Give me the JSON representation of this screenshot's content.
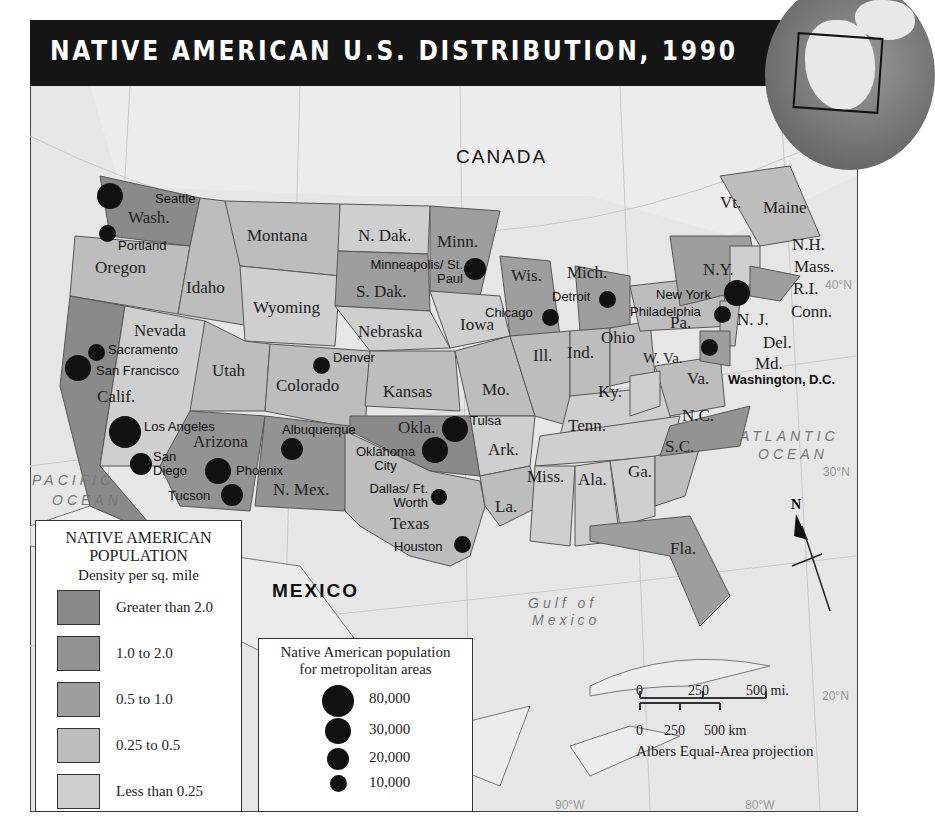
{
  "title": "NATIVE AMERICAN U.S. DISTRIBUTION, 1990",
  "colors": {
    "greater_than_2": "#8a8a8a",
    "1_to_2": "#939393",
    "0_5_to_1": "#9e9e9e",
    "0_25_to_0_5": "#bdbdbd",
    "less_than_0_25": "#cfcfcf",
    "water": "#e6e6e6",
    "title_bar": "#151515"
  },
  "countries": {
    "canada": "CANADA",
    "mexico": "MEXICO"
  },
  "water_bodies": {
    "pacific_1": "PACIFIC",
    "pacific_2": "OCEAN",
    "atlantic_1": "ATLANTIC",
    "atlantic_2": "OCEAN",
    "gulf_1": "Gulf of",
    "gulf_2": "Mexico"
  },
  "graticule": {
    "lat40": "40°N",
    "lat30": "30°N",
    "lat20": "20°N",
    "lon90": "90°W",
    "lon80": "80°W"
  },
  "states": [
    {
      "name": "Wash.",
      "density": "greater_than_2"
    },
    {
      "name": "Oregon",
      "density": "0_25_to_0_5"
    },
    {
      "name": "Idaho",
      "density": "0_25_to_0_5"
    },
    {
      "name": "Montana",
      "density": "0_25_to_0_5"
    },
    {
      "name": "Wyoming",
      "density": "less_than_0_25"
    },
    {
      "name": "Nevada",
      "density": "less_than_0_25"
    },
    {
      "name": "Calif.",
      "density": "greater_than_2"
    },
    {
      "name": "Utah",
      "density": "0_25_to_0_5"
    },
    {
      "name": "Colorado",
      "density": "0_25_to_0_5"
    },
    {
      "name": "Arizona",
      "density": "1_to_2"
    },
    {
      "name": "N. Mex.",
      "density": "1_to_2"
    },
    {
      "name": "N. Dak.",
      "density": "less_than_0_25"
    },
    {
      "name": "S. Dak.",
      "density": "0_5_to_1"
    },
    {
      "name": "Nebraska",
      "density": "less_than_0_25"
    },
    {
      "name": "Kansas",
      "density": "0_25_to_0_5"
    },
    {
      "name": "Okla.",
      "density": "greater_than_2"
    },
    {
      "name": "Texas",
      "density": "0_25_to_0_5"
    },
    {
      "name": "Minn.",
      "density": "0_5_to_1"
    },
    {
      "name": "Iowa",
      "density": "less_than_0_25"
    },
    {
      "name": "Mo.",
      "density": "0_25_to_0_5"
    },
    {
      "name": "Ark.",
      "density": "less_than_0_25"
    },
    {
      "name": "La.",
      "density": "0_25_to_0_5"
    },
    {
      "name": "Wis.",
      "density": "0_5_to_1"
    },
    {
      "name": "Ill.",
      "density": "0_25_to_0_5"
    },
    {
      "name": "Mich.",
      "density": "0_5_to_1"
    },
    {
      "name": "Ind.",
      "density": "0_25_to_0_5"
    },
    {
      "name": "Ohio",
      "density": "0_25_to_0_5"
    },
    {
      "name": "Ky.",
      "density": "less_than_0_25"
    },
    {
      "name": "Tenn.",
      "density": "less_than_0_25"
    },
    {
      "name": "Miss.",
      "density": "less_than_0_25"
    },
    {
      "name": "Ala.",
      "density": "less_than_0_25"
    },
    {
      "name": "Ga.",
      "density": "less_than_0_25"
    },
    {
      "name": "Fla.",
      "density": "0_5_to_1"
    },
    {
      "name": "S.C.",
      "density": "0_25_to_0_5"
    },
    {
      "name": "N.C.",
      "density": "1_to_2"
    },
    {
      "name": "Va.",
      "density": "0_25_to_0_5"
    },
    {
      "name": "W. Va.",
      "density": "less_than_0_25"
    },
    {
      "name": "Pa.",
      "density": "0_25_to_0_5"
    },
    {
      "name": "N.Y.",
      "density": "0_5_to_1"
    },
    {
      "name": "Vt.",
      "density": "less_than_0_25"
    },
    {
      "name": "Maine",
      "density": "0_25_to_0_5"
    },
    {
      "name": "N.H.",
      "density": "less_than_0_25"
    },
    {
      "name": "Mass.",
      "density": "0_5_to_1"
    },
    {
      "name": "R.I.",
      "density": "0_5_to_1"
    },
    {
      "name": "Conn.",
      "density": "0_5_to_1"
    },
    {
      "name": "N. J.",
      "density": "0_25_to_0_5"
    },
    {
      "name": "Del.",
      "density": "0_25_to_0_5"
    },
    {
      "name": "Md.",
      "density": "0_5_to_1"
    }
  ],
  "cities": [
    {
      "name": "Seattle",
      "size": 30000
    },
    {
      "name": "Portland",
      "size": 10000
    },
    {
      "name": "Sacramento",
      "size": 10000
    },
    {
      "name": "San Francisco",
      "size": 30000
    },
    {
      "name": "Los Angeles",
      "size": 80000
    },
    {
      "name": "San Diego",
      "size": 20000
    },
    {
      "name": "Phoenix",
      "size": 30000
    },
    {
      "name": "Tucson",
      "size": 20000
    },
    {
      "name": "Albuquerque",
      "size": 20000
    },
    {
      "name": "Denver",
      "size": 10000
    },
    {
      "name": "Minneapolis/ St. Paul",
      "size": 20000
    },
    {
      "name": "Tulsa",
      "size": 30000
    },
    {
      "name": "Oklahoma City",
      "size": 30000
    },
    {
      "name": "Dallas/ Ft. Worth",
      "size": 10000
    },
    {
      "name": "Houston",
      "size": 10000
    },
    {
      "name": "Chicago",
      "size": 10000
    },
    {
      "name": "Detroit",
      "size": 10000
    },
    {
      "name": "New York",
      "size": 30000
    },
    {
      "name": "Philadelphia",
      "size": 10000
    },
    {
      "name": "Washington, D.C.",
      "size": 10000
    }
  ],
  "legend_density": {
    "title_1": "NATIVE AMERICAN",
    "title_2": "POPULATION",
    "subtitle": "Density per sq. mile",
    "items": [
      {
        "label": "Greater than 2.0"
      },
      {
        "label": "1.0 to 2.0"
      },
      {
        "label": "0.5 to 1.0"
      },
      {
        "label": "0.25 to 0.5"
      },
      {
        "label": "Less than 0.25"
      }
    ]
  },
  "legend_metro": {
    "title_1": "Native American population",
    "title_2": "for metropolitan areas",
    "items": [
      {
        "label": "80,000"
      },
      {
        "label": "30,000"
      },
      {
        "label": "20,000"
      },
      {
        "label": "10,000"
      }
    ]
  },
  "scale": {
    "mi_0": "0",
    "mi_250": "250",
    "mi_500": "500 mi.",
    "km_0": "0",
    "km_250": "250",
    "km_500": "500 km",
    "projection": "Albers Equal-Area projection"
  },
  "compass": "N"
}
